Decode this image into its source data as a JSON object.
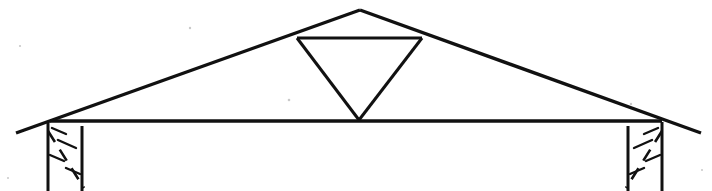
{
  "document": {
    "title": "Roof Truss Cross-Section",
    "drawing_type": "line-drawing",
    "background_color": "#ffffff",
    "ink_color": "#111111",
    "width": 712,
    "height": 191
  },
  "diagram": {
    "name": "roof-truss-section",
    "labels": [],
    "annotations": [],
    "parts": [
      {
        "id": "left-rafter",
        "label": "Left rafter (top chord)"
      },
      {
        "id": "right-rafter",
        "label": "Right rafter (top chord)"
      },
      {
        "id": "collar-tie",
        "label": "Collar tie"
      },
      {
        "id": "left-web-strut",
        "label": "Left web strut"
      },
      {
        "id": "right-web-strut",
        "label": "Right web strut"
      },
      {
        "id": "bottom-chord",
        "label": "Bottom chord / ceiling joist"
      },
      {
        "id": "left-wall",
        "label": "Left bearing wall"
      },
      {
        "id": "right-wall",
        "label": "Right bearing wall"
      }
    ]
  },
  "geometry": {
    "apex": {
      "x": 360,
      "y": 10
    },
    "left_eave": {
      "x": 16,
      "y": 133
    },
    "right_eave": {
      "x": 701,
      "y": 133
    },
    "collar_left": {
      "x": 297,
      "y": 38
    },
    "collar_right": {
      "x": 422,
      "y": 38
    },
    "web_foot": {
      "x": 359,
      "y": 120
    },
    "bottom_chord_y": 120,
    "bottom_chord_left": 50,
    "bottom_chord_right": 662,
    "left_wall": {
      "outer_x": 48,
      "inner_x": 82,
      "top_y": 122,
      "bottom_y": 191
    },
    "right_wall": {
      "outer_x": 662,
      "inner_x": 628,
      "top_y": 122,
      "bottom_y": 191
    }
  },
  "paths": {
    "left_rafter": "M 16 133 L 360 10",
    "right_rafter": "M 360 10 L 701 133",
    "collar_tie": "M 297 38 L 422 38",
    "left_web": "M 297 38 L 359 120",
    "right_web": "M 422 38 L 359 120",
    "bottom_chord": "M 50 121 L 662 121",
    "left_wall_outer": "M 48 122 L 48 191",
    "left_wall_inner": "M 82 126 L 82 191",
    "right_wall_outer": "M 662 122 L 662 191",
    "right_wall_inner": "M 628 126 L 628 191",
    "left_wall_diagonal": "M 48 131 L 84 188",
    "right_wall_diagonal": "M 662 131 L 626 188"
  },
  "hatching": {
    "left_wall_marks": [
      {
        "x1": 52,
        "y1": 128,
        "x2": 66,
        "y2": 134
      },
      {
        "x1": 58,
        "y1": 140,
        "x2": 76,
        "y2": 148
      },
      {
        "x1": 50,
        "y1": 155,
        "x2": 64,
        "y2": 161
      },
      {
        "x1": 66,
        "y1": 168,
        "x2": 80,
        "y2": 174
      }
    ],
    "right_wall_marks": [
      {
        "x1": 658,
        "y1": 128,
        "x2": 644,
        "y2": 134
      },
      {
        "x1": 652,
        "y1": 140,
        "x2": 634,
        "y2": 148
      },
      {
        "x1": 660,
        "y1": 155,
        "x2": 646,
        "y2": 161
      },
      {
        "x1": 644,
        "y1": 168,
        "x2": 630,
        "y2": 174
      }
    ]
  },
  "specks": [
    {
      "cx": 190,
      "cy": 28,
      "r": 1.2
    },
    {
      "cx": 289,
      "cy": 100,
      "r": 1.3
    },
    {
      "cx": 20,
      "cy": 46,
      "r": 1.1
    },
    {
      "cx": 631,
      "cy": 104,
      "r": 1.2
    },
    {
      "cx": 8,
      "cy": 178,
      "r": 1.0
    },
    {
      "cx": 702,
      "cy": 170,
      "r": 1.0
    }
  ]
}
